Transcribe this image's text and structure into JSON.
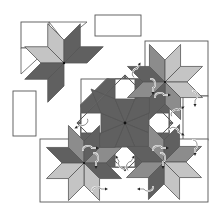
{
  "diagram": {
    "colors": {
      "background": "#ffffff",
      "outline": "#555555",
      "dark": "#606060",
      "medium": "#8c8c8c",
      "light": "#c4c4c4",
      "white": "#ffffff",
      "seam_arrow": "#ffffff",
      "center_dot": "#111111"
    },
    "components": [
      {
        "id": "loose-star-block",
        "label": "Loose star unit (top-left)"
      },
      {
        "id": "loose-rectangle-top",
        "label": "Loose rectangle (top)"
      },
      {
        "id": "loose-rectangle-left",
        "label": "Loose rectangle (left)"
      },
      {
        "id": "center-star",
        "label": "Center eight-pointed star with set-in squares"
      },
      {
        "id": "corner-star-top-right",
        "label": "Corner star unit (top-right)"
      },
      {
        "id": "corner-star-bottom-left",
        "label": "Corner star unit (bottom-left)"
      },
      {
        "id": "corner-star-bottom-right",
        "label": "Corner star unit (bottom-right)"
      }
    ],
    "annotations": {
      "seam_pressing_arrows": "curved white arrows indicating seam pressing direction"
    }
  }
}
